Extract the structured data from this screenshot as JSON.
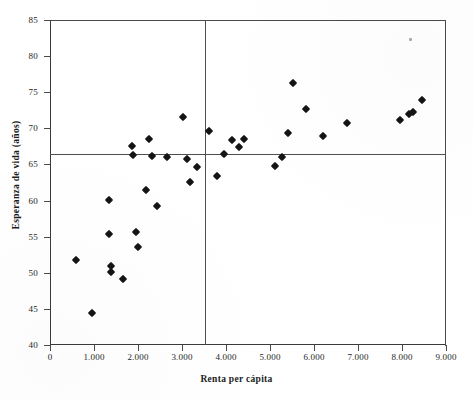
{
  "chart_data": {
    "type": "scatter",
    "title": "",
    "xlabel": "Renta per cápita",
    "ylabel": "Esperanza de vida (años)",
    "xlim": [
      0,
      9000
    ],
    "ylim": [
      40,
      85
    ],
    "xticks": [
      0,
      1000,
      2000,
      3000,
      4000,
      5000,
      6000,
      7000,
      8000,
      9000
    ],
    "xticklabels": [
      "0",
      "1.000",
      "2.000",
      "3.000",
      "4.000",
      "5.000",
      "6.000",
      "7.000",
      "8.000",
      "9.000"
    ],
    "yticks": [
      40,
      45,
      50,
      55,
      60,
      65,
      70,
      75,
      80,
      85
    ],
    "yticklabels": [
      "40",
      "45",
      "50",
      "55",
      "60",
      "65",
      "70",
      "75",
      "80",
      "85"
    ],
    "grid": false,
    "legend": null,
    "marker": "diamond",
    "marker_color": "#141414",
    "reference_lines": [
      {
        "orientation": "horizontal",
        "value": 66.5,
        "label": "media esperanza de vida",
        "color": "#4f4f4f"
      },
      {
        "orientation": "vertical",
        "value": 3520,
        "label": "media renta per cápita",
        "color": "#4f4f4f"
      }
    ],
    "points": [
      {
        "x": 600,
        "y": 51.8
      },
      {
        "x": 950,
        "y": 44.5
      },
      {
        "x": 1330,
        "y": 60.1
      },
      {
        "x": 1340,
        "y": 55.4
      },
      {
        "x": 1380,
        "y": 51.0
      },
      {
        "x": 1380,
        "y": 50.1
      },
      {
        "x": 1650,
        "y": 49.2
      },
      {
        "x": 1860,
        "y": 67.5
      },
      {
        "x": 1880,
        "y": 66.3
      },
      {
        "x": 1960,
        "y": 55.7
      },
      {
        "x": 2000,
        "y": 53.6
      },
      {
        "x": 2190,
        "y": 61.4
      },
      {
        "x": 2250,
        "y": 68.5
      },
      {
        "x": 2320,
        "y": 66.2
      },
      {
        "x": 2430,
        "y": 59.3
      },
      {
        "x": 2660,
        "y": 66.0
      },
      {
        "x": 3020,
        "y": 71.6
      },
      {
        "x": 3120,
        "y": 65.8
      },
      {
        "x": 3180,
        "y": 62.6
      },
      {
        "x": 3330,
        "y": 64.6
      },
      {
        "x": 3610,
        "y": 69.6
      },
      {
        "x": 3790,
        "y": 63.4
      },
      {
        "x": 3950,
        "y": 66.4
      },
      {
        "x": 4140,
        "y": 68.4
      },
      {
        "x": 4290,
        "y": 67.4
      },
      {
        "x": 4400,
        "y": 68.5
      },
      {
        "x": 5120,
        "y": 64.8
      },
      {
        "x": 5280,
        "y": 66.0
      },
      {
        "x": 5420,
        "y": 69.4
      },
      {
        "x": 5520,
        "y": 76.3
      },
      {
        "x": 5820,
        "y": 72.7
      },
      {
        "x": 6200,
        "y": 69.0
      },
      {
        "x": 6760,
        "y": 70.7
      },
      {
        "x": 7950,
        "y": 71.2
      },
      {
        "x": 8150,
        "y": 72.0
      },
      {
        "x": 8250,
        "y": 72.2
      },
      {
        "x": 8450,
        "y": 73.9
      }
    ]
  }
}
